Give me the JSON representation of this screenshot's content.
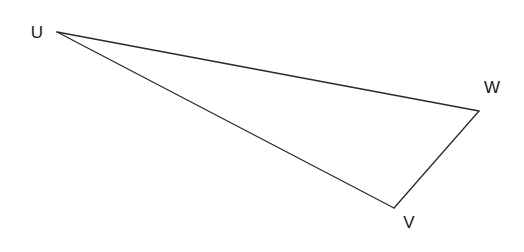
{
  "diagram": {
    "type": "triangle",
    "colors": {
      "stroke": "#2a2a2a",
      "label": "#1a1a1a",
      "background": "#ffffff"
    },
    "vertices": [
      {
        "id": "U",
        "label": "U",
        "x": 57,
        "y": 32,
        "label_x": 37,
        "label_y": 32
      },
      {
        "id": "W",
        "label": "W",
        "x": 479,
        "y": 111,
        "label_x": 492,
        "label_y": 87
      },
      {
        "id": "V",
        "label": "V",
        "x": 394,
        "y": 208,
        "label_x": 409,
        "label_y": 222
      }
    ],
    "edges": [
      {
        "from": "U",
        "to": "W"
      },
      {
        "from": "W",
        "to": "V"
      },
      {
        "from": "V",
        "to": "U"
      }
    ]
  }
}
